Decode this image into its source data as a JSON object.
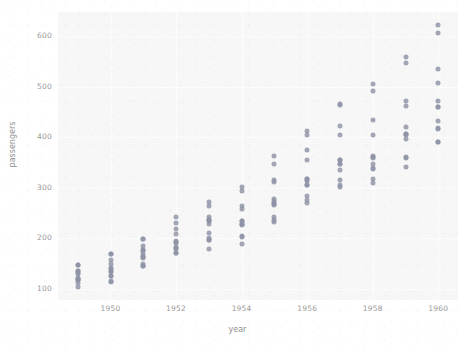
{
  "chart_data": {
    "type": "scatter",
    "title": "",
    "xlabel": "year",
    "ylabel": "passengers",
    "xlim": [
      1948.4,
      1960.6
    ],
    "ylim": [
      78,
      648
    ],
    "grid": true,
    "legend": null,
    "x_ticks": [
      "1950",
      "1952",
      "1954",
      "1956",
      "1958",
      "1960"
    ],
    "x_tick_values": [
      1950,
      1952,
      1954,
      1956,
      1958,
      1960
    ],
    "y_ticks": [
      "100",
      "200",
      "300",
      "400",
      "500",
      "600"
    ],
    "y_tick_values": [
      100,
      200,
      300,
      400,
      500,
      600
    ],
    "marker_color": "#8d93a6",
    "plot_bg_color": "#f7f7f7",
    "figure_bg_color": "#ffffff",
    "tick_label_color": "#9a9a9a",
    "axis_label_color": "#8f8f8f",
    "series": [
      {
        "name": "passengers",
        "x": [
          1949,
          1949,
          1949,
          1949,
          1949,
          1949,
          1949,
          1949,
          1949,
          1949,
          1949,
          1949,
          1950,
          1950,
          1950,
          1950,
          1950,
          1950,
          1950,
          1950,
          1950,
          1950,
          1950,
          1950,
          1951,
          1951,
          1951,
          1951,
          1951,
          1951,
          1951,
          1951,
          1951,
          1951,
          1951,
          1951,
          1952,
          1952,
          1952,
          1952,
          1952,
          1952,
          1952,
          1952,
          1952,
          1952,
          1952,
          1952,
          1953,
          1953,
          1953,
          1953,
          1953,
          1953,
          1953,
          1953,
          1953,
          1953,
          1953,
          1953,
          1954,
          1954,
          1954,
          1954,
          1954,
          1954,
          1954,
          1954,
          1954,
          1954,
          1954,
          1954,
          1955,
          1955,
          1955,
          1955,
          1955,
          1955,
          1955,
          1955,
          1955,
          1955,
          1955,
          1955,
          1956,
          1956,
          1956,
          1956,
          1956,
          1956,
          1956,
          1956,
          1956,
          1956,
          1956,
          1956,
          1957,
          1957,
          1957,
          1957,
          1957,
          1957,
          1957,
          1957,
          1957,
          1957,
          1957,
          1957,
          1958,
          1958,
          1958,
          1958,
          1958,
          1958,
          1958,
          1958,
          1958,
          1958,
          1958,
          1958,
          1959,
          1959,
          1959,
          1959,
          1959,
          1959,
          1959,
          1959,
          1959,
          1959,
          1959,
          1959,
          1960,
          1960,
          1960,
          1960,
          1960,
          1960,
          1960,
          1960,
          1960,
          1960,
          1960,
          1960
        ],
        "y": [
          112,
          118,
          132,
          129,
          121,
          135,
          148,
          148,
          136,
          119,
          104,
          118,
          115,
          126,
          141,
          135,
          125,
          149,
          170,
          170,
          158,
          133,
          114,
          140,
          145,
          150,
          178,
          163,
          172,
          178,
          199,
          199,
          184,
          162,
          146,
          166,
          171,
          180,
          193,
          181,
          183,
          218,
          230,
          242,
          209,
          191,
          172,
          194,
          196,
          196,
          236,
          235,
          229,
          243,
          264,
          272,
          237,
          211,
          180,
          201,
          204,
          188,
          235,
          227,
          234,
          264,
          302,
          293,
          259,
          229,
          203,
          229,
          242,
          233,
          267,
          269,
          270,
          315,
          364,
          347,
          312,
          274,
          237,
          278,
          284,
          277,
          317,
          313,
          318,
          374,
          413,
          405,
          355,
          306,
          271,
          306,
          315,
          301,
          356,
          348,
          355,
          422,
          465,
          467,
          404,
          347,
          305,
          336,
          340,
          318,
          362,
          348,
          363,
          435,
          491,
          505,
          404,
          359,
          310,
          337,
          360,
          342,
          406,
          396,
          420,
          472,
          548,
          559,
          463,
          407,
          362,
          405,
          417,
          391,
          419,
          461,
          472,
          535,
          622,
          606,
          508,
          461,
          390,
          432
        ]
      }
    ]
  }
}
